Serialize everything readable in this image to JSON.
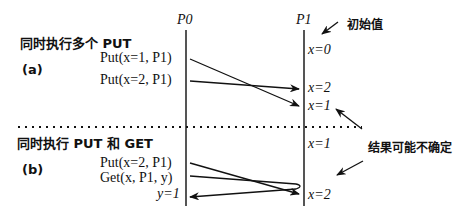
{
  "processes": {
    "p0": "P0",
    "p1": "P1"
  },
  "annotations": {
    "initial_value": "初始值",
    "uncertain": "结果可能不确定"
  },
  "section_a": {
    "title": "同时执行多个 PUT",
    "label": "(a)",
    "ops": [
      "Put(x=1, P1)",
      "Put(x=2, P1)"
    ],
    "p1_values": [
      "x=0",
      "x=2",
      "x=1"
    ]
  },
  "section_b": {
    "title": "同时执行 PUT 和 GET",
    "label": "(b)",
    "ops": [
      "Put(x=2, P1)",
      "Get(x, P1, y)"
    ],
    "result": "y=1",
    "p1_values": [
      "x=1",
      "x=2"
    ]
  },
  "colors": {
    "line": "#222222",
    "timeline": "#555555"
  }
}
